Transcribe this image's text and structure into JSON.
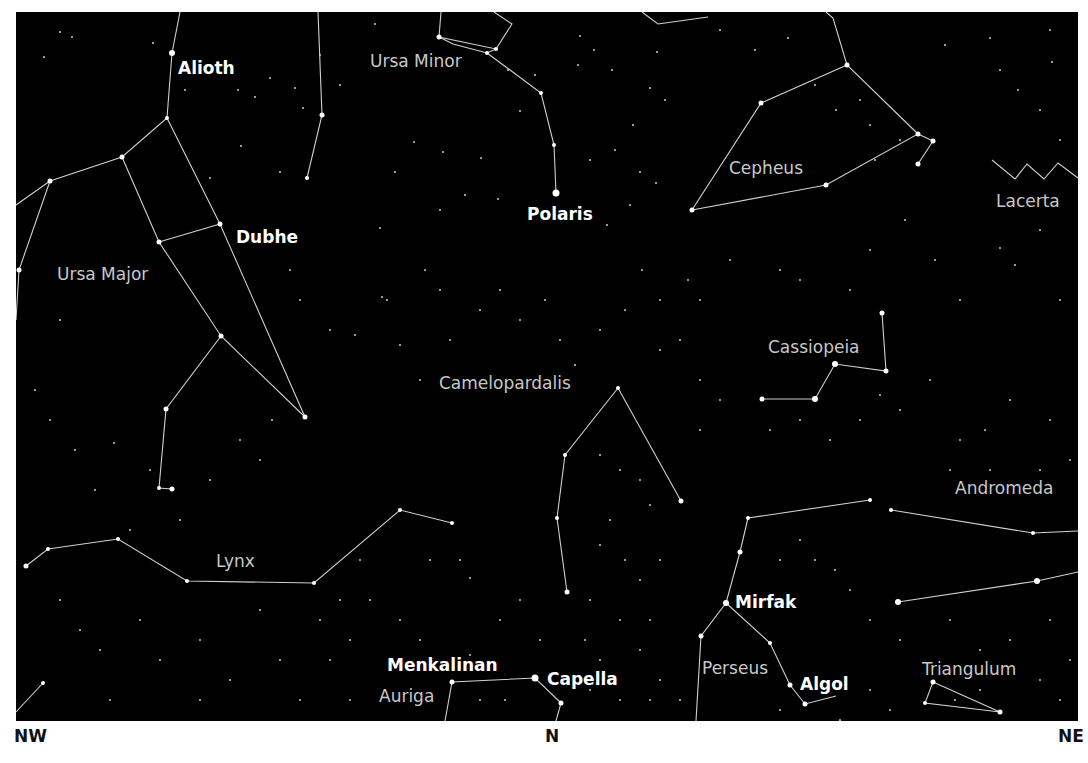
{
  "map": {
    "frame": {
      "x": 16,
      "y": 12,
      "width": 1062,
      "height": 709
    },
    "colors": {
      "sky": "#000000",
      "line": "#d0d0d0",
      "star": "#ffffff",
      "constellation_label": "#c8c8c8",
      "star_label": "#ffffff",
      "page": "#ffffff"
    },
    "compass": [
      {
        "label": "NW",
        "x": 14
      },
      {
        "label": "N",
        "x": 545
      },
      {
        "label": "NE",
        "x": 1058
      }
    ],
    "constellation_labels": [
      {
        "name": "Ursa Minor",
        "x": 370,
        "y": 67
      },
      {
        "name": "Cepheus",
        "x": 729,
        "y": 174
      },
      {
        "name": "Lacerta",
        "x": 996,
        "y": 207
      },
      {
        "name": "Ursa Major",
        "x": 57,
        "y": 280
      },
      {
        "name": "Cassiopeia",
        "x": 768,
        "y": 353
      },
      {
        "name": "Camelopardalis",
        "x": 439,
        "y": 389
      },
      {
        "name": "Andromeda",
        "x": 955,
        "y": 494
      },
      {
        "name": "Lynx",
        "x": 216,
        "y": 567
      },
      {
        "name": "Perseus",
        "x": 702,
        "y": 674
      },
      {
        "name": "Triangulum",
        "x": 922,
        "y": 675
      },
      {
        "name": "Auriga",
        "x": 379,
        "y": 702
      }
    ],
    "star_labels": [
      {
        "name": "Alioth",
        "x": 178,
        "y": 74
      },
      {
        "name": "Polaris",
        "x": 527,
        "y": 220
      },
      {
        "name": "Dubhe",
        "x": 236,
        "y": 243
      },
      {
        "name": "Mirfak",
        "x": 735,
        "y": 608
      },
      {
        "name": "Menkalinan",
        "x": 387,
        "y": 671
      },
      {
        "name": "Capella",
        "x": 547,
        "y": 685
      },
      {
        "name": "Algol",
        "x": 800,
        "y": 690
      }
    ],
    "lines": [
      [
        [
          180,
          12
        ],
        [
          172,
          53
        ],
        [
          167,
          118
        ],
        [
          122,
          157
        ],
        [
          50,
          181
        ],
        [
          16,
          205
        ]
      ],
      [
        [
          167,
          118
        ],
        [
          220,
          224
        ],
        [
          305,
          417
        ]
      ],
      [
        [
          122,
          157
        ],
        [
          159,
          242
        ],
        [
          221,
          336
        ],
        [
          305,
          417
        ]
      ],
      [
        [
          159,
          242
        ],
        [
          220,
          224
        ]
      ],
      [
        [
          50,
          181
        ],
        [
          19,
          270
        ],
        [
          16,
          320
        ]
      ],
      [
        [
          221,
          336
        ],
        [
          166,
          409
        ],
        [
          159,
          488
        ],
        [
          172,
          489
        ]
      ],
      [
        [
          318,
          12
        ],
        [
          322,
          115
        ],
        [
          307,
          178
        ]
      ],
      [
        [
          441,
          12
        ],
        [
          439,
          37
        ],
        [
          496,
          49
        ],
        [
          512,
          24
        ],
        [
          494,
          12
        ]
      ],
      [
        [
          496,
          49
        ],
        [
          487,
          53
        ],
        [
          453,
          44
        ],
        [
          439,
          37
        ]
      ],
      [
        [
          487,
          53
        ],
        [
          541,
          93
        ],
        [
          554,
          145
        ],
        [
          556,
          193
        ]
      ],
      [
        [
          642,
          12
        ],
        [
          658,
          24
        ],
        [
          708,
          17
        ]
      ],
      [
        [
          826,
          12
        ],
        [
          833,
          18
        ],
        [
          847,
          65
        ],
        [
          918,
          134
        ],
        [
          826,
          185
        ],
        [
          692,
          210
        ],
        [
          761,
          103
        ],
        [
          847,
          65
        ]
      ],
      [
        [
          918,
          134
        ],
        [
          933,
          141
        ],
        [
          918,
          164
        ]
      ],
      [
        [
          992,
          160
        ],
        [
          1015,
          179
        ],
        [
          1027,
          164
        ],
        [
          1044,
          179
        ],
        [
          1058,
          163
        ],
        [
          1078,
          178
        ]
      ],
      [
        [
          882,
          313
        ],
        [
          886,
          371
        ],
        [
          835,
          364
        ],
        [
          815,
          399
        ],
        [
          762,
          399
        ]
      ],
      [
        [
          618,
          388
        ],
        [
          565,
          455
        ],
        [
          557,
          518
        ],
        [
          567,
          592
        ]
      ],
      [
        [
          618,
          388
        ],
        [
          681,
          501
        ]
      ],
      [
        [
          26,
          566
        ],
        [
          48,
          549
        ],
        [
          118,
          539
        ],
        [
          187,
          581
        ],
        [
          314,
          583
        ],
        [
          400,
          510
        ],
        [
          452,
          523
        ]
      ],
      [
        [
          16,
          712
        ],
        [
          43,
          683
        ]
      ],
      [
        [
          748,
          518
        ],
        [
          870,
          500
        ]
      ],
      [
        [
          748,
          518
        ],
        [
          740,
          552
        ],
        [
          726,
          603
        ],
        [
          701,
          636
        ],
        [
          696,
          721
        ]
      ],
      [
        [
          726,
          603
        ],
        [
          770,
          643
        ],
        [
          790,
          685
        ],
        [
          805,
          704
        ],
        [
          836,
          696
        ]
      ],
      [
        [
          891,
          510
        ],
        [
          1033,
          533
        ],
        [
          1078,
          531
        ]
      ],
      [
        [
          898,
          602
        ],
        [
          1037,
          581
        ],
        [
          1078,
          572
        ]
      ],
      [
        [
          445,
          721
        ],
        [
          452,
          682
        ],
        [
          535,
          678
        ],
        [
          561,
          703
        ],
        [
          556,
          721
        ]
      ],
      [
        [
          933,
          682
        ],
        [
          925,
          703
        ],
        [
          1000,
          712
        ],
        [
          933,
          682
        ]
      ]
    ],
    "bright_stars": [
      [
        172,
        53,
        3
      ],
      [
        167,
        118,
        2
      ],
      [
        122,
        157,
        2.5
      ],
      [
        50,
        181,
        2.5
      ],
      [
        220,
        224,
        2.5
      ],
      [
        159,
        242,
        2.5
      ],
      [
        221,
        336,
        2.5
      ],
      [
        305,
        417,
        2.5
      ],
      [
        19,
        270,
        2.5
      ],
      [
        166,
        409,
        2.5
      ],
      [
        159,
        488,
        2
      ],
      [
        172,
        489,
        2.5
      ],
      [
        322,
        115,
        2.5
      ],
      [
        307,
        178,
        2
      ],
      [
        439,
        37,
        2.5
      ],
      [
        496,
        49,
        2
      ],
      [
        487,
        53,
        2
      ],
      [
        541,
        93,
        2
      ],
      [
        554,
        145,
        2
      ],
      [
        556,
        193,
        3.5
      ],
      [
        847,
        65,
        2.5
      ],
      [
        761,
        103,
        2.5
      ],
      [
        918,
        134,
        2.5
      ],
      [
        933,
        141,
        2.5
      ],
      [
        918,
        164,
        2.5
      ],
      [
        826,
        185,
        2.5
      ],
      [
        692,
        210,
        2.5
      ],
      [
        882,
        313,
        2.5
      ],
      [
        886,
        371,
        2.5
      ],
      [
        835,
        364,
        3
      ],
      [
        815,
        399,
        3
      ],
      [
        762,
        399,
        2.5
      ],
      [
        618,
        388,
        2
      ],
      [
        565,
        455,
        2
      ],
      [
        557,
        518,
        2
      ],
      [
        567,
        592,
        2.5
      ],
      [
        681,
        501,
        2.5
      ],
      [
        26,
        566,
        2.5
      ],
      [
        48,
        549,
        2
      ],
      [
        118,
        539,
        2
      ],
      [
        187,
        581,
        2
      ],
      [
        314,
        583,
        2
      ],
      [
        400,
        510,
        2
      ],
      [
        452,
        523,
        2
      ],
      [
        43,
        683,
        2
      ],
      [
        748,
        518,
        2
      ],
      [
        870,
        500,
        2
      ],
      [
        740,
        552,
        2.5
      ],
      [
        726,
        603,
        3
      ],
      [
        701,
        636,
        2.5
      ],
      [
        770,
        643,
        2
      ],
      [
        790,
        685,
        2.5
      ],
      [
        805,
        704,
        2.5
      ],
      [
        898,
        602,
        3
      ],
      [
        1037,
        581,
        3
      ],
      [
        891,
        510,
        2
      ],
      [
        1033,
        533,
        2
      ],
      [
        452,
        682,
        2.5
      ],
      [
        535,
        678,
        3.5
      ],
      [
        561,
        703,
        2.5
      ],
      [
        933,
        682,
        2.5
      ],
      [
        925,
        703,
        2
      ],
      [
        1000,
        712,
        2.5
      ]
    ],
    "faint_stars": [
      [
        60,
        32
      ],
      [
        72,
        37
      ],
      [
        44,
        57
      ],
      [
        153,
        43
      ],
      [
        185,
        90
      ],
      [
        238,
        90
      ],
      [
        255,
        97
      ],
      [
        295,
        88
      ],
      [
        270,
        78
      ],
      [
        303,
        108
      ],
      [
        241,
        146
      ],
      [
        210,
        178
      ],
      [
        280,
        172
      ],
      [
        320,
        55
      ],
      [
        340,
        85
      ],
      [
        375,
        24
      ],
      [
        394,
        62
      ],
      [
        414,
        142
      ],
      [
        443,
        152
      ],
      [
        481,
        158
      ],
      [
        508,
        70
      ],
      [
        520,
        111
      ],
      [
        535,
        75
      ],
      [
        578,
        65
      ],
      [
        580,
        36
      ],
      [
        594,
        50
      ],
      [
        612,
        70
      ],
      [
        650,
        88
      ],
      [
        657,
        52
      ],
      [
        665,
        100
      ],
      [
        590,
        160
      ],
      [
        615,
        150
      ],
      [
        633,
        125
      ],
      [
        640,
        172
      ],
      [
        656,
        183
      ],
      [
        630,
        205
      ],
      [
        607,
        225
      ],
      [
        395,
        172
      ],
      [
        380,
        228
      ],
      [
        440,
        210
      ],
      [
        465,
        195
      ],
      [
        498,
        199
      ],
      [
        387,
        300
      ],
      [
        425,
        270
      ],
      [
        440,
        290
      ],
      [
        720,
        30
      ],
      [
        755,
        50
      ],
      [
        788,
        38
      ],
      [
        815,
        85
      ],
      [
        836,
        110
      ],
      [
        860,
        100
      ],
      [
        870,
        125
      ],
      [
        875,
        160
      ],
      [
        900,
        140
      ],
      [
        945,
        45
      ],
      [
        990,
        38
      ],
      [
        1000,
        70
      ],
      [
        1050,
        30
      ],
      [
        1052,
        62
      ],
      [
        1040,
        110
      ],
      [
        1018,
        90
      ],
      [
        1060,
        140
      ],
      [
        1000,
        248
      ],
      [
        1015,
        265
      ],
      [
        1040,
        230
      ],
      [
        1060,
        300
      ],
      [
        960,
        300
      ],
      [
        935,
        260
      ],
      [
        905,
        220
      ],
      [
        870,
        250
      ],
      [
        850,
        290
      ],
      [
        800,
        280
      ],
      [
        780,
        270
      ],
      [
        730,
        260
      ],
      [
        700,
        300
      ],
      [
        688,
        280
      ],
      [
        660,
        300
      ],
      [
        60,
        320
      ],
      [
        35,
        390
      ],
      [
        50,
        420
      ],
      [
        75,
        450
      ],
      [
        95,
        490
      ],
      [
        114,
        443
      ],
      [
        150,
        470
      ],
      [
        130,
        530
      ],
      [
        180,
        520
      ],
      [
        210,
        480
      ],
      [
        240,
        440
      ],
      [
        260,
        460
      ],
      [
        272,
        420
      ],
      [
        330,
        330
      ],
      [
        300,
        300
      ],
      [
        290,
        270
      ],
      [
        355,
        335
      ],
      [
        382,
        297
      ],
      [
        400,
        345
      ],
      [
        420,
        380
      ],
      [
        450,
        340
      ],
      [
        480,
        310
      ],
      [
        500,
        290
      ],
      [
        520,
        320
      ],
      [
        545,
        300
      ],
      [
        560,
        340
      ],
      [
        575,
        365
      ],
      [
        600,
        330
      ],
      [
        625,
        310
      ],
      [
        642,
        270
      ],
      [
        660,
        350
      ],
      [
        680,
        340
      ],
      [
        700,
        380
      ],
      [
        720,
        400
      ],
      [
        700,
        430
      ],
      [
        770,
        430
      ],
      [
        800,
        420
      ],
      [
        830,
        440
      ],
      [
        860,
        420
      ],
      [
        880,
        395
      ],
      [
        900,
        410
      ],
      [
        930,
        380
      ],
      [
        960,
        440
      ],
      [
        985,
        430
      ],
      [
        1010,
        400
      ],
      [
        1050,
        420
      ],
      [
        1070,
        460
      ],
      [
        1040,
        470
      ],
      [
        990,
        470
      ],
      [
        950,
        470
      ],
      [
        600,
        455
      ],
      [
        620,
        470
      ],
      [
        640,
        480
      ],
      [
        650,
        505
      ],
      [
        610,
        520
      ],
      [
        600,
        545
      ],
      [
        625,
        560
      ],
      [
        640,
        580
      ],
      [
        660,
        560
      ],
      [
        590,
        600
      ],
      [
        620,
        620
      ],
      [
        650,
        620
      ],
      [
        585,
        640
      ],
      [
        600,
        660
      ],
      [
        640,
        650
      ],
      [
        660,
        680
      ],
      [
        680,
        700
      ],
      [
        780,
        560
      ],
      [
        800,
        540
      ],
      [
        815,
        560
      ],
      [
        835,
        570
      ],
      [
        850,
        590
      ],
      [
        870,
        620
      ],
      [
        900,
        640
      ],
      [
        950,
        620
      ],
      [
        980,
        650
      ],
      [
        1010,
        640
      ],
      [
        1050,
        620
      ],
      [
        1070,
        660
      ],
      [
        1060,
        700
      ],
      [
        980,
        690
      ],
      [
        955,
        700
      ],
      [
        1040,
        680
      ],
      [
        60,
        600
      ],
      [
        80,
        630
      ],
      [
        100,
        650
      ],
      [
        140,
        620
      ],
      [
        160,
        660
      ],
      [
        200,
        640
      ],
      [
        230,
        680
      ],
      [
        260,
        610
      ],
      [
        280,
        660
      ],
      [
        320,
        620
      ],
      [
        330,
        660
      ],
      [
        350,
        640
      ],
      [
        370,
        600
      ],
      [
        400,
        620
      ],
      [
        420,
        640
      ],
      [
        470,
        578
      ],
      [
        500,
        620
      ],
      [
        520,
        600
      ],
      [
        540,
        640
      ],
      [
        480,
        700
      ],
      [
        505,
        700
      ],
      [
        590,
        690
      ],
      [
        620,
        700
      ],
      [
        650,
        700
      ],
      [
        470,
        655
      ],
      [
        780,
        710
      ],
      [
        840,
        720
      ],
      [
        870,
        690
      ],
      [
        890,
        710
      ],
      [
        460,
        560
      ],
      [
        430,
        560
      ],
      [
        360,
        560
      ],
      [
        340,
        600
      ],
      [
        110,
        700
      ],
      [
        200,
        700
      ],
      [
        300,
        700
      ],
      [
        350,
        700
      ]
    ]
  }
}
